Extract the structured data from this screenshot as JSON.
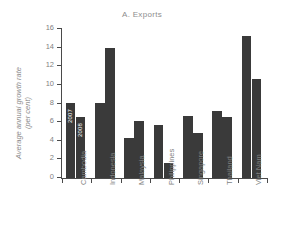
{
  "chart_data": {
    "type": "bar",
    "title": "A. Exports",
    "xlabel": "",
    "ylabel": "Average annual growth rate\n(per cent)",
    "ylim": [
      0,
      16
    ],
    "yticks": [
      0,
      2,
      4,
      6,
      8,
      10,
      12,
      14,
      16
    ],
    "ytick_labels": [
      "0",
      "2",
      "4",
      "6",
      "8",
      "10",
      "12",
      "14",
      "16"
    ],
    "grid": false,
    "legend_position": "inline-annotation",
    "categories": [
      "Cambodia",
      "Indonesia",
      "Malaysia",
      "Philippines",
      "Singapore",
      "Thailand",
      "Viet Nam"
    ],
    "series": [
      {
        "name": "2007",
        "color": "#3a3a3a",
        "values": [
          8.1,
          8.1,
          4.3,
          5.7,
          6.7,
          7.2,
          15.3
        ]
      },
      {
        "name": "2008",
        "color": "#3a3a3a",
        "values": [
          6.5,
          14.0,
          6.1,
          1.6,
          4.8,
          6.6,
          10.6
        ]
      }
    ],
    "annotations": [
      {
        "text": "2007",
        "series": "2007",
        "category": "Cambodia"
      },
      {
        "text": "2008",
        "series": "2008",
        "category": "Cambodia"
      }
    ]
  },
  "colors": {
    "background": "#ffffff",
    "axis": "#4a4a4a",
    "tick_label": "#7f7f7f",
    "title": "#8d8d8d",
    "bar": "#3a3a3a",
    "annotation_text": "#ffffff"
  }
}
